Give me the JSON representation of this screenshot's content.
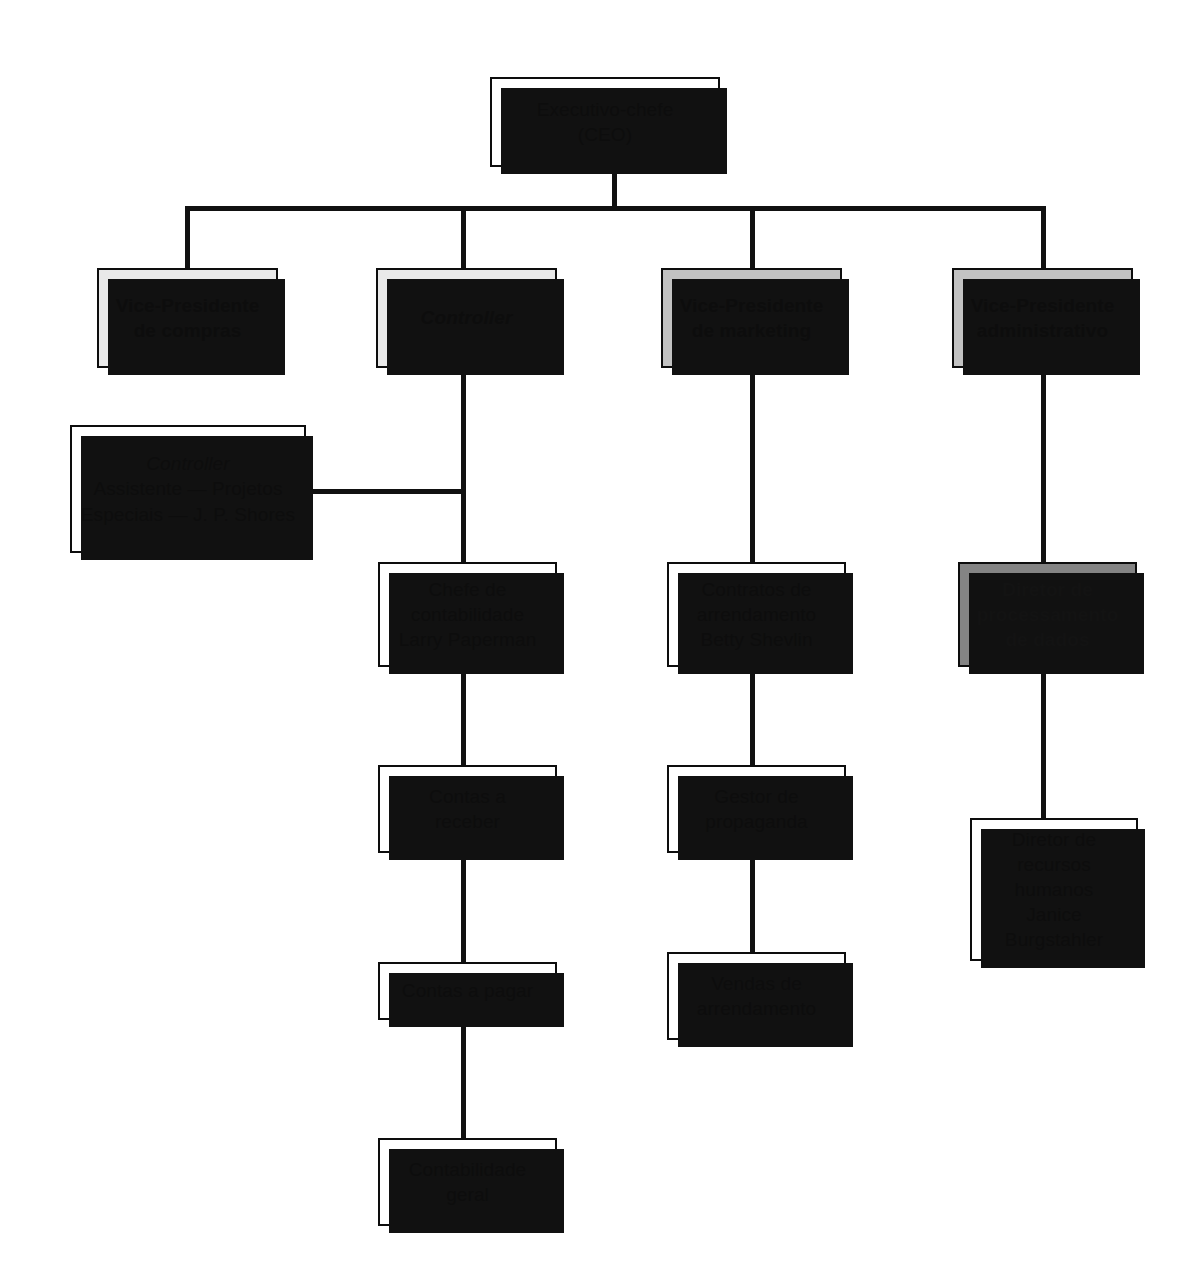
{
  "diagram": {
    "type": "organizational-chart",
    "colors": {
      "line": "#111111",
      "border": "#0d0d0d",
      "fill_white": "#ffffff",
      "fill_light_gray": "#e9e9e9",
      "fill_mid_gray": "#c2c2c2",
      "fill_dark_gray": "#848484",
      "shadow": "#111111",
      "text": "#0d0d0d"
    }
  },
  "nodes": {
    "ceo": {
      "lines": [
        "Executivo-chefe",
        "(CEO)"
      ],
      "fill": "white"
    },
    "vp_compras": {
      "lines": [
        "Vice-Presidente",
        "de compras"
      ],
      "fill": "light-gray"
    },
    "controller": {
      "lines": [
        "Controller"
      ],
      "fill": "light-gray",
      "italic": true
    },
    "vp_marketing": {
      "lines": [
        "Vice-Presidente",
        "de marketing"
      ],
      "fill": "mid-gray"
    },
    "vp_administrativo": {
      "lines": [
        "Vice-Presidente",
        "administrativo"
      ],
      "fill": "mid-gray"
    },
    "assistente_projetos": {
      "title": "Controller",
      "lines": [
        "Assistente — Projetos",
        "Especiais — J. P. Shores"
      ],
      "fill": "white",
      "title_italic": true
    },
    "chefe_contabilidade": {
      "lines": [
        "Chefe de",
        "contabilidade",
        "Larry Paperman"
      ],
      "fill": "white"
    },
    "contas_receber": {
      "lines": [
        "Contas a",
        "receber"
      ],
      "fill": "white"
    },
    "contas_pagar": {
      "lines": [
        "Contas a pagar"
      ],
      "fill": "white"
    },
    "contabilidade_geral": {
      "lines": [
        "Contabilidade",
        "geral"
      ],
      "fill": "white"
    },
    "contratos_arrendamento": {
      "lines": [
        "Contratos de",
        "arrendamento",
        "Betty Shevlin"
      ],
      "fill": "white"
    },
    "gestor_propaganda": {
      "lines": [
        "Gestor de",
        "propaganda"
      ],
      "fill": "white"
    },
    "vendas_arrendamento": {
      "lines": [
        "Vendas de",
        "arrendamento"
      ],
      "fill": "white"
    },
    "diretor_processamento": {
      "lines": [
        "Diretor de",
        "processamento",
        "de dados"
      ],
      "fill": "dark-gray"
    },
    "diretor_rh": {
      "lines": [
        "Diretor de",
        "recursos",
        "humanos",
        "Janice",
        "Burgstahler"
      ],
      "fill": "white"
    }
  }
}
